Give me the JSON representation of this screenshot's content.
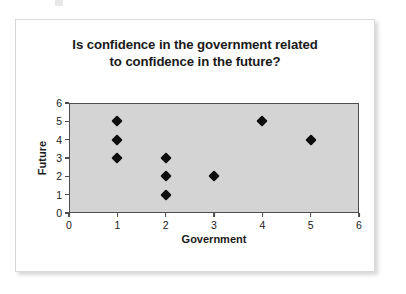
{
  "chart_data": {
    "type": "scatter",
    "title": "Is confidence in the government related to confidence in the future?",
    "title_lines": [
      "Is confidence in the government related",
      "to confidence in the future?"
    ],
    "xlabel": "Government",
    "ylabel": "Future",
    "xlim": [
      0,
      6
    ],
    "ylim": [
      0,
      6
    ],
    "xticks": [
      "0",
      "1",
      "2",
      "3",
      "4",
      "5",
      "6"
    ],
    "yticks": [
      "0",
      "1",
      "2",
      "3",
      "4",
      "5",
      "6"
    ],
    "grid": false,
    "legend": false,
    "marker": "diamond",
    "marker_color": "#0d0d0d",
    "plot_background": "#d4d4d4",
    "plot_border_color": "#4d4d4d",
    "points": [
      {
        "x": 1,
        "y": 5
      },
      {
        "x": 1,
        "y": 4
      },
      {
        "x": 1,
        "y": 3
      },
      {
        "x": 2,
        "y": 3
      },
      {
        "x": 2,
        "y": 2
      },
      {
        "x": 2,
        "y": 1
      },
      {
        "x": 3,
        "y": 2
      },
      {
        "x": 4,
        "y": 5
      },
      {
        "x": 5,
        "y": 4
      }
    ]
  }
}
